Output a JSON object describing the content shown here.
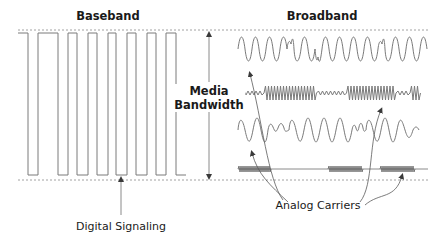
{
  "diagram": {
    "title_left": "Baseband",
    "title_right": "Broadband",
    "center_label_line1": "Media",
    "center_label_line2": "Bandwidth",
    "bottom_left_label": "Digital Signaling",
    "bottom_right_label": "Analog Carriers",
    "colors": {
      "stroke": "#7a7a7a",
      "text": "#1a1a1a",
      "dotted": "#8a8a8a",
      "arrow": "#6a6a6a"
    },
    "baseband_pulses": [
      {
        "x_rise": 28,
        "x_fall": 38
      },
      {
        "x_rise": 58,
        "x_fall": 68
      },
      {
        "x_rise": 77,
        "x_fall": 88
      },
      {
        "x_rise": 97,
        "x_fall": 108
      },
      {
        "x_rise": 116,
        "x_fall": 127
      },
      {
        "x_rise": 136,
        "x_fall": 147
      },
      {
        "x_rise": 156,
        "x_fall": 166
      },
      {
        "x_rise": 176,
        "x_fall": 186
      }
    ],
    "broadband_rows": [
      {
        "name": "carrier-1",
        "type": "modulated-sine",
        "y_center": 49
      },
      {
        "name": "carrier-2",
        "type": "fsk-high-frequency",
        "y_center": 93
      },
      {
        "name": "carrier-3",
        "type": "modulated-sine",
        "y_center": 130
      },
      {
        "name": "carrier-4",
        "type": "burst-ask",
        "y_center": 169
      }
    ]
  }
}
